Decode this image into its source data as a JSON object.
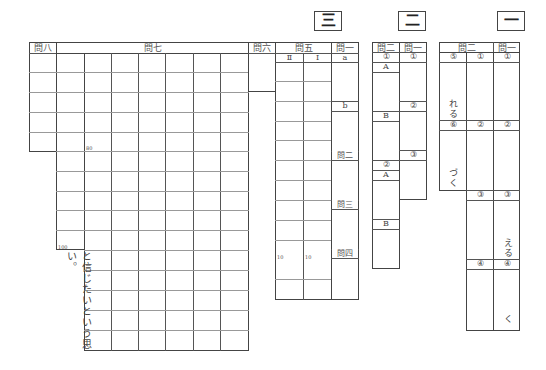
{
  "sections": {
    "three": {
      "label": "三"
    },
    "two": {
      "label": "二"
    },
    "one": {
      "label": "一"
    }
  },
  "section3": {
    "q8": {
      "header": "問八"
    },
    "q7": {
      "header": "問七",
      "marker_80": "80",
      "marker_100": "100",
      "suffix_text": "と信じたいという思い。"
    },
    "q6": {
      "header": "問六"
    },
    "q5": {
      "header": "問五",
      "sub": [
        "Ⅱ",
        "Ⅰ"
      ],
      "marker_10a": "10",
      "marker_10b": "10"
    },
    "q1": {
      "header": "問一",
      "items": [
        "a",
        "b"
      ]
    },
    "q2": {
      "header": "問二"
    },
    "q3": {
      "header": "問三"
    },
    "q4": {
      "header": "問四"
    }
  },
  "section2": {
    "q2": {
      "header": "問二",
      "items": [
        "①",
        "A",
        "B",
        "②",
        "A",
        "B"
      ]
    },
    "q1": {
      "header": "問一",
      "items": [
        "①",
        "②",
        "③"
      ]
    }
  },
  "section1": {
    "q2": {
      "header": "問二",
      "items": [
        "⑤",
        "①",
        "⑥",
        "②",
        "③",
        "④"
      ],
      "suffix_5": "れる",
      "suffix_6": "づく"
    },
    "q1": {
      "header": "問一",
      "items": [
        "①",
        "②",
        "③",
        "④"
      ],
      "suffix_3": "える",
      "suffix_4": "く"
    }
  }
}
